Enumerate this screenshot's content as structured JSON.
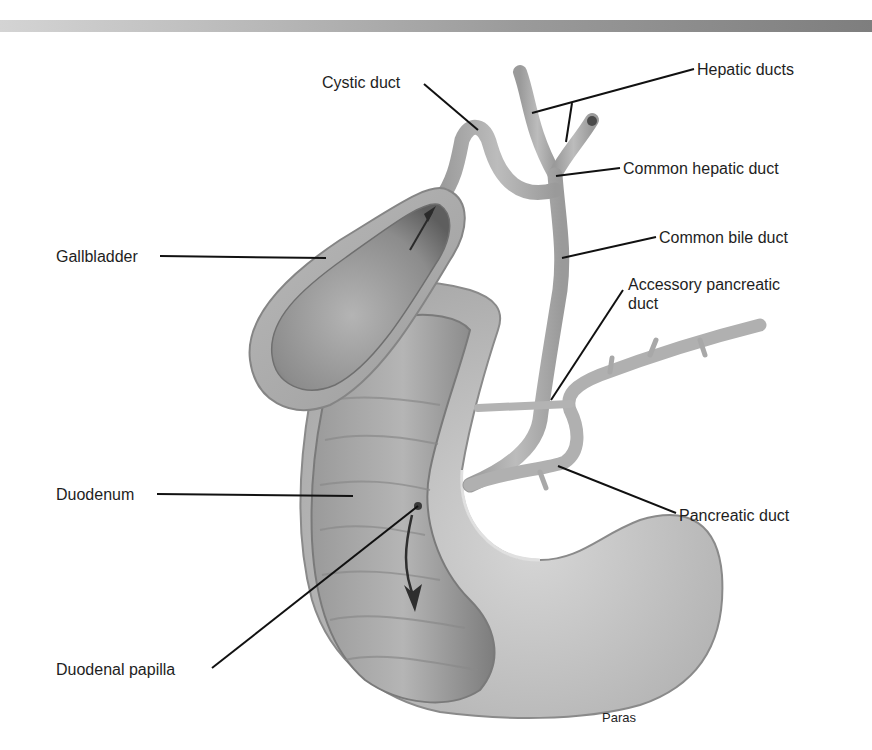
{
  "figure": {
    "type": "anatomical illustration",
    "credit": "Paras"
  },
  "labels": {
    "cystic_duct": "Cystic duct",
    "hepatic_ducts": "Hepatic ducts",
    "common_hepatic_duct": "Common hepatic duct",
    "common_bile_duct": "Common bile duct",
    "accessory_pancreatic_duct": "Accessory pancreatic\nduct",
    "gallbladder": "Gallbladder",
    "duodenum": "Duodenum",
    "pancreatic_duct": "Pancreatic duct",
    "duodenal_papilla": "Duodenal papilla"
  },
  "colors": {
    "background": "#ffffff",
    "tissue_light": "#c8c8c8",
    "tissue_mid": "#a8a8a8",
    "tissue_dark": "#6e6e6e",
    "leader_line": "#111111",
    "text": "#1e1e1e"
  }
}
